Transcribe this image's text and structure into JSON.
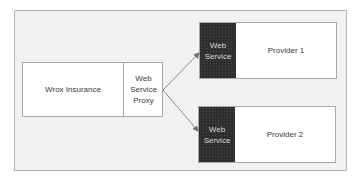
{
  "diagram": {
    "client": {
      "label": "Wrox Insurance",
      "proxy_label": "Web Service Proxy"
    },
    "providers": [
      {
        "service_label": "Web Service",
        "label": "Provider 1"
      },
      {
        "service_label": "Web Service",
        "label": "Provider 2"
      }
    ],
    "connections": [
      {
        "from": "Web Service Proxy",
        "to": "Provider 1 Web Service"
      },
      {
        "from": "Web Service Proxy",
        "to": "Provider 2 Web Service"
      }
    ],
    "colors": {
      "background": "#f1f1f1",
      "box": "#ffffff",
      "service_block": "#2e2e2e",
      "arrow": "#8a8a8a"
    }
  }
}
